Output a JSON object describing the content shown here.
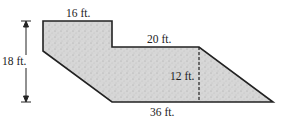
{
  "figure": {
    "type": "composite-shape-dimension-diagram",
    "fill_color": "#d9d9d9",
    "stroke_color": "#222222",
    "labels": {
      "top_width": "16 ft.",
      "step_width": "20 ft.",
      "total_height": "18 ft.",
      "inner_height": "12 ft.",
      "bottom_width": "36 ft."
    }
  }
}
